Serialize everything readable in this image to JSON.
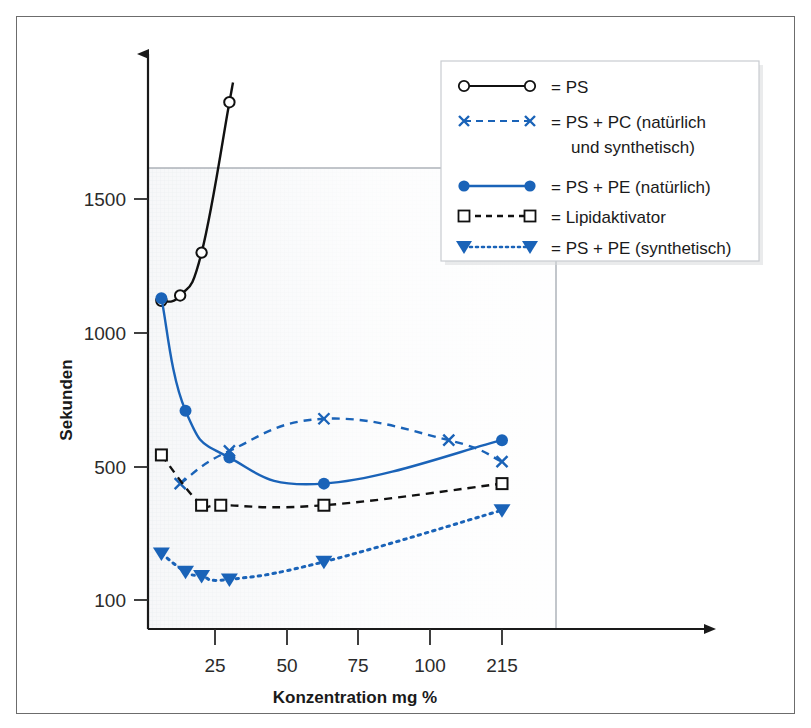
{
  "chart_data": {
    "type": "line",
    "title": "",
    "xlabel": "Konzentration mg %",
    "ylabel": "Sekunden",
    "x_ticks": [
      25,
      50,
      75,
      100,
      215
    ],
    "x_tick_labels": [
      "25",
      "50",
      "75",
      "100",
      "215"
    ],
    "y_ticks": [
      100,
      500,
      1000,
      1500
    ],
    "y_tick_labels": [
      "100",
      "500",
      "1000",
      "1500"
    ],
    "xlim": [
      0,
      230
    ],
    "ylim": [
      0,
      1950
    ],
    "grid": false,
    "legend_position": "top-right",
    "series": [
      {
        "name": "PS",
        "label": "= PS",
        "color": "#111111",
        "line_style": "solid",
        "marker": "open-circle",
        "points": [
          {
            "x": 5,
            "y": 1120
          },
          {
            "x": 12,
            "y": 1140
          },
          {
            "x": 20,
            "y": 1300
          },
          {
            "x": 30,
            "y": 1860
          }
        ]
      },
      {
        "name": "PS + PC (naturlich und synthetisch)",
        "label": "= PS + PC (natürlich",
        "label2": "und synthetisch)",
        "color": "#1a63b8",
        "line_style": "dashed",
        "marker": "cross",
        "points": [
          {
            "x": 12,
            "y": 450
          },
          {
            "x": 30,
            "y": 560
          },
          {
            "x": 63,
            "y": 680
          },
          {
            "x": 130,
            "y": 600
          },
          {
            "x": 215,
            "y": 520
          }
        ]
      },
      {
        "name": "PS + PE (naturlich)",
        "label": "= PS + PE (natürlich)",
        "color": "#1a63b8",
        "line_style": "solid",
        "marker": "filled-circle",
        "points": [
          {
            "x": 5,
            "y": 1130
          },
          {
            "x": 14,
            "y": 710
          },
          {
            "x": 30,
            "y": 535
          },
          {
            "x": 63,
            "y": 450
          },
          {
            "x": 215,
            "y": 600
          }
        ]
      },
      {
        "name": "Lipidaktivator",
        "label": "= Lipidaktivator",
        "color": "#111111",
        "line_style": "dashed",
        "marker": "open-square",
        "points": [
          {
            "x": 5,
            "y": 545
          },
          {
            "x": 20,
            "y": 385
          },
          {
            "x": 27,
            "y": 385
          },
          {
            "x": 63,
            "y": 385
          },
          {
            "x": 215,
            "y": 450
          }
        ]
      },
      {
        "name": "PS + PE (synthetisch)",
        "label": "= PS + PE (synthetisch)",
        "color": "#1a63b8",
        "line_style": "dotted",
        "marker": "filled-triangle-down",
        "points": [
          {
            "x": 5,
            "y": 240
          },
          {
            "x": 14,
            "y": 185
          },
          {
            "x": 20,
            "y": 172
          },
          {
            "x": 30,
            "y": 162
          },
          {
            "x": 63,
            "y": 215
          },
          {
            "x": 215,
            "y": 370
          }
        ]
      }
    ]
  },
  "colors": {
    "blue": "#1a63b8",
    "black": "#111111",
    "frame": "#6c6c6c",
    "plot_bg": "#f4f5f7"
  }
}
